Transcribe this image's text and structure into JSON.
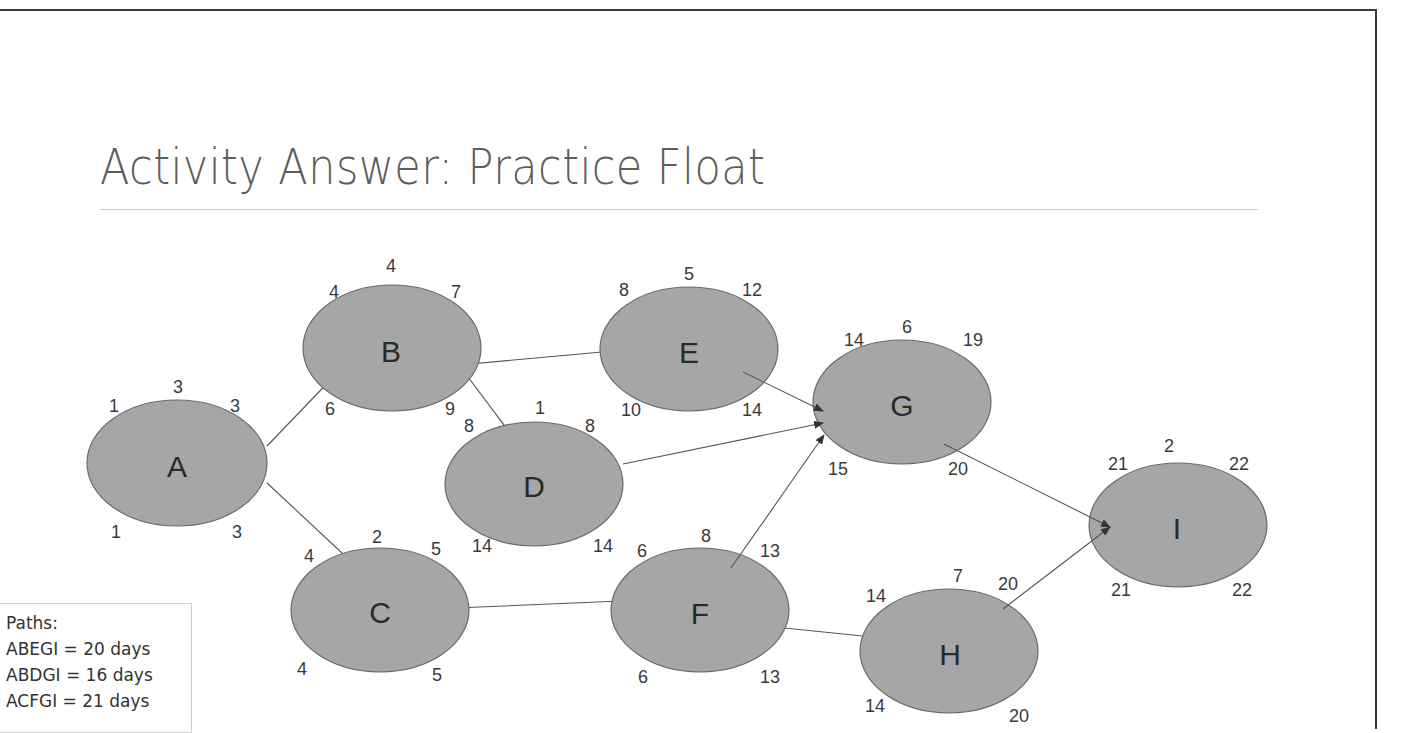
{
  "slide": {
    "title": "Activity Answer: Practice Float"
  },
  "paths_box": {
    "heading": "Paths:",
    "lines": [
      "ABEGI = 20 days",
      "ABDGI = 16 days",
      "ACFGI = 21 days"
    ]
  },
  "colors": {
    "node_fill": "#a6a6a6",
    "node_stroke": "#6a6a6a",
    "title_text": "#5d5d5d",
    "edge": "#555555"
  },
  "nodes": {
    "A": {
      "label": "A",
      "duration": "3",
      "es": "1",
      "ef": "3",
      "ls": "1",
      "lf": "3"
    },
    "B": {
      "label": "B",
      "duration": "4",
      "es": "4",
      "ef": "7",
      "ls": "6",
      "lf": "9"
    },
    "C": {
      "label": "C",
      "duration": "2",
      "es": "4",
      "ef": "5",
      "ls": "4",
      "lf": "5"
    },
    "D": {
      "label": "D",
      "duration": "1",
      "es": "8",
      "ef": "8",
      "ls": "14",
      "lf": "14"
    },
    "E": {
      "label": "E",
      "duration": "5",
      "es": "8",
      "ef": "12",
      "ls": "10",
      "lf": "14"
    },
    "F": {
      "label": "F",
      "duration": "8",
      "es": "6",
      "ef": "13",
      "ls": "6",
      "lf": "13"
    },
    "G": {
      "label": "G",
      "duration": "6",
      "es": "14",
      "ef": "19",
      "ls": "15",
      "lf": "20"
    },
    "H": {
      "label": "H",
      "duration": "7",
      "es": "14",
      "ef": "20",
      "ls": "14",
      "lf": "20"
    },
    "I": {
      "label": "I",
      "duration": "2",
      "es": "21",
      "ef": "22",
      "ls": "21",
      "lf": "22"
    }
  },
  "edges": [
    [
      "A",
      "B"
    ],
    [
      "A",
      "C"
    ],
    [
      "B",
      "E"
    ],
    [
      "B",
      "D"
    ],
    [
      "C",
      "F"
    ],
    [
      "E",
      "G"
    ],
    [
      "D",
      "G"
    ],
    [
      "F",
      "G"
    ],
    [
      "F",
      "H"
    ],
    [
      "G",
      "I"
    ],
    [
      "H",
      "I"
    ]
  ]
}
